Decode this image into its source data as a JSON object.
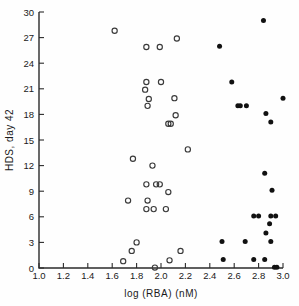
{
  "chart_data": {
    "type": "scatter",
    "title": "",
    "xlabel": "log (RBA) (nM)",
    "ylabel": "HDS, day 42",
    "xlim": [
      1.0,
      3.0
    ],
    "ylim": [
      0,
      30
    ],
    "grid": false,
    "legend_position": "none",
    "xticks": [
      "1.0",
      "1.2",
      "1.4",
      "1.6",
      "1.8",
      "2.0",
      "2.2",
      "2.4",
      "2.6",
      "2.8",
      "3.0"
    ],
    "xtick_values": [
      1.0,
      1.2,
      1.4,
      1.6,
      1.8,
      2.0,
      2.2,
      2.4,
      2.6,
      2.8,
      3.0
    ],
    "yticks": [
      "0",
      "3",
      "6",
      "9",
      "12",
      "15",
      "18",
      "21",
      "24",
      "27",
      "30"
    ],
    "ytick_values": [
      0,
      3,
      6,
      9,
      12,
      15,
      18,
      21,
      24,
      27,
      30
    ],
    "series": [
      {
        "name": "open-circles",
        "marker": "open-circle",
        "color": "#3a3a3a",
        "points": [
          [
            1.62,
            27.8
          ],
          [
            1.88,
            25.9
          ],
          [
            1.99,
            25.9
          ],
          [
            2.13,
            26.9
          ],
          [
            1.88,
            21.8
          ],
          [
            2.0,
            21.8
          ],
          [
            1.87,
            20.9
          ],
          [
            1.9,
            19.8
          ],
          [
            1.89,
            19.0
          ],
          [
            2.11,
            19.9
          ],
          [
            2.12,
            17.9
          ],
          [
            2.06,
            16.9
          ],
          [
            2.08,
            16.9
          ],
          [
            2.22,
            13.9
          ],
          [
            1.77,
            12.8
          ],
          [
            1.93,
            12.0
          ],
          [
            1.88,
            9.8
          ],
          [
            1.96,
            9.8
          ],
          [
            1.99,
            9.8
          ],
          [
            2.06,
            8.9
          ],
          [
            1.89,
            7.9
          ],
          [
            1.73,
            7.9
          ],
          [
            1.88,
            6.9
          ],
          [
            1.94,
            6.9
          ],
          [
            2.04,
            6.9
          ],
          [
            1.8,
            3.0
          ],
          [
            1.76,
            2.0
          ],
          [
            2.16,
            2.0
          ],
          [
            1.69,
            0.8
          ],
          [
            2.07,
            0.9
          ],
          [
            1.95,
            0.05
          ]
        ]
      },
      {
        "name": "filled-circles",
        "marker": "filled-circle",
        "color": "#111111",
        "points": [
          [
            2.84,
            29.0
          ],
          [
            2.48,
            26.0
          ],
          [
            2.58,
            21.8
          ],
          [
            3.0,
            19.9
          ],
          [
            2.63,
            19.0
          ],
          [
            2.65,
            19.0
          ],
          [
            2.7,
            19.0
          ],
          [
            2.86,
            18.1
          ],
          [
            2.9,
            17.1
          ],
          [
            2.85,
            11.1
          ],
          [
            2.91,
            9.1
          ],
          [
            2.76,
            6.1
          ],
          [
            2.8,
            6.1
          ],
          [
            2.9,
            6.1
          ],
          [
            2.94,
            6.1
          ],
          [
            2.89,
            5.2
          ],
          [
            2.86,
            4.1
          ],
          [
            2.5,
            3.1
          ],
          [
            2.69,
            3.1
          ],
          [
            2.9,
            3.1
          ],
          [
            2.51,
            1.0
          ],
          [
            2.76,
            1.0
          ],
          [
            2.85,
            1.0
          ],
          [
            2.93,
            0.1
          ],
          [
            2.95,
            0.1
          ]
        ]
      }
    ]
  }
}
